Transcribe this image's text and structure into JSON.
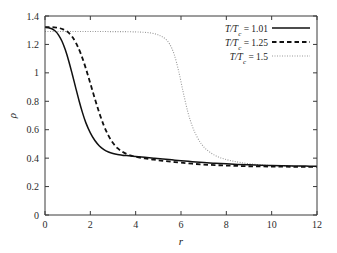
{
  "figure": {
    "background": "#ffffff",
    "frame_color": "#3a3a3a"
  },
  "chart_data": {
    "type": "line",
    "title": "",
    "xlabel": "r",
    "ylabel": "ρ",
    "xlim": [
      0,
      12
    ],
    "ylim": [
      0,
      1.4
    ],
    "xticks": [
      0,
      2,
      4,
      6,
      8,
      10,
      12
    ],
    "yticks": [
      0,
      0.2,
      0.4,
      0.6,
      0.8,
      1,
      1.2,
      1.4
    ],
    "xticklabels": [
      "0",
      "2",
      "4",
      "6",
      "8",
      "10",
      "12"
    ],
    "yticklabels": [
      "0",
      "0.2",
      "0.4",
      "0.6",
      "0.8",
      "1",
      "1.2",
      "1.4"
    ],
    "grid": false,
    "legend_position": "upper right",
    "series": [
      {
        "name": "T/Tc = 1.01",
        "label_prefix": "T/T",
        "label_sub": "c",
        "label_value": "= 1.01",
        "style": "solid",
        "color": "#111111",
        "x": [
          0,
          0.15,
          0.3,
          0.45,
          0.6,
          0.75,
          0.9,
          1.05,
          1.2,
          1.35,
          1.5,
          1.65,
          1.8,
          2.0,
          2.2,
          2.4,
          2.6,
          2.8,
          3.0,
          3.2,
          3.4,
          3.6,
          3.8,
          4.0,
          4.4,
          4.8,
          5.2,
          5.6,
          6.0,
          6.5,
          7.0,
          7.5,
          8.0,
          8.5,
          9.0,
          9.5,
          10.0,
          10.5,
          11.0,
          11.5,
          12.0
        ],
        "y": [
          1.32,
          1.318,
          1.31,
          1.294,
          1.266,
          1.222,
          1.16,
          1.082,
          0.992,
          0.898,
          0.806,
          0.722,
          0.65,
          0.578,
          0.524,
          0.486,
          0.46,
          0.443,
          0.432,
          0.425,
          0.421,
          0.418,
          0.415,
          0.412,
          0.406,
          0.4,
          0.394,
          0.388,
          0.382,
          0.375,
          0.369,
          0.364,
          0.36,
          0.356,
          0.353,
          0.35,
          0.348,
          0.346,
          0.345,
          0.344,
          0.343
        ]
      },
      {
        "name": "T/Tc = 1.25",
        "label_prefix": "T/T",
        "label_sub": "c",
        "label_value": "= 1.25",
        "style": "dashed",
        "color": "#111111",
        "x": [
          0,
          0.2,
          0.4,
          0.6,
          0.8,
          1.0,
          1.2,
          1.4,
          1.6,
          1.8,
          2.0,
          2.2,
          2.4,
          2.6,
          2.8,
          3.0,
          3.2,
          3.4,
          3.6,
          3.8,
          4.0,
          4.4,
          4.8,
          5.2,
          5.6,
          6.0,
          6.5,
          7.0,
          7.5,
          8.0,
          8.5,
          9.0,
          9.5,
          10.0,
          10.5,
          11.0,
          11.5,
          12.0
        ],
        "y": [
          1.322,
          1.322,
          1.32,
          1.316,
          1.306,
          1.288,
          1.254,
          1.2,
          1.126,
          1.032,
          0.926,
          0.818,
          0.716,
          0.628,
          0.558,
          0.506,
          0.47,
          0.446,
          0.429,
          0.418,
          0.41,
          0.398,
          0.389,
          0.381,
          0.374,
          0.368,
          0.361,
          0.355,
          0.351,
          0.348,
          0.345,
          0.343,
          0.342,
          0.341,
          0.34,
          0.339,
          0.339,
          0.338
        ]
      },
      {
        "name": "T/Tc = 1.5",
        "label_prefix": "T/T",
        "label_sub": "c",
        "label_value": "= 1.5",
        "style": "dotted",
        "color": "#9a9a9a",
        "x": [
          0,
          0.5,
          1.0,
          1.5,
          2.0,
          2.5,
          3.0,
          3.5,
          4.0,
          4.3,
          4.6,
          4.9,
          5.1,
          5.3,
          5.5,
          5.7,
          5.9,
          6.1,
          6.3,
          6.5,
          6.7,
          6.9,
          7.1,
          7.4,
          7.7,
          8.0,
          8.3,
          8.6,
          9.0,
          9.5,
          10.0,
          10.5,
          11.0,
          11.5,
          12.0
        ],
        "y": [
          1.291,
          1.291,
          1.291,
          1.291,
          1.291,
          1.291,
          1.29,
          1.29,
          1.288,
          1.286,
          1.282,
          1.272,
          1.26,
          1.24,
          1.202,
          1.13,
          1.01,
          0.862,
          0.726,
          0.624,
          0.552,
          0.5,
          0.464,
          0.428,
          0.405,
          0.39,
          0.379,
          0.37,
          0.361,
          0.353,
          0.348,
          0.345,
          0.343,
          0.341,
          0.34
        ]
      }
    ]
  },
  "legend": {
    "entries": [
      {
        "text_prefix": "T/T",
        "text_sub": "c",
        "text_value": "= 1.01",
        "style": "solid"
      },
      {
        "text_prefix": "T/T",
        "text_sub": "c",
        "text_value": "= 1.25",
        "style": "dashed"
      },
      {
        "text_prefix": "T/T",
        "text_sub": "c",
        "text_value": "= 1.5",
        "style": "dotted"
      }
    ]
  }
}
